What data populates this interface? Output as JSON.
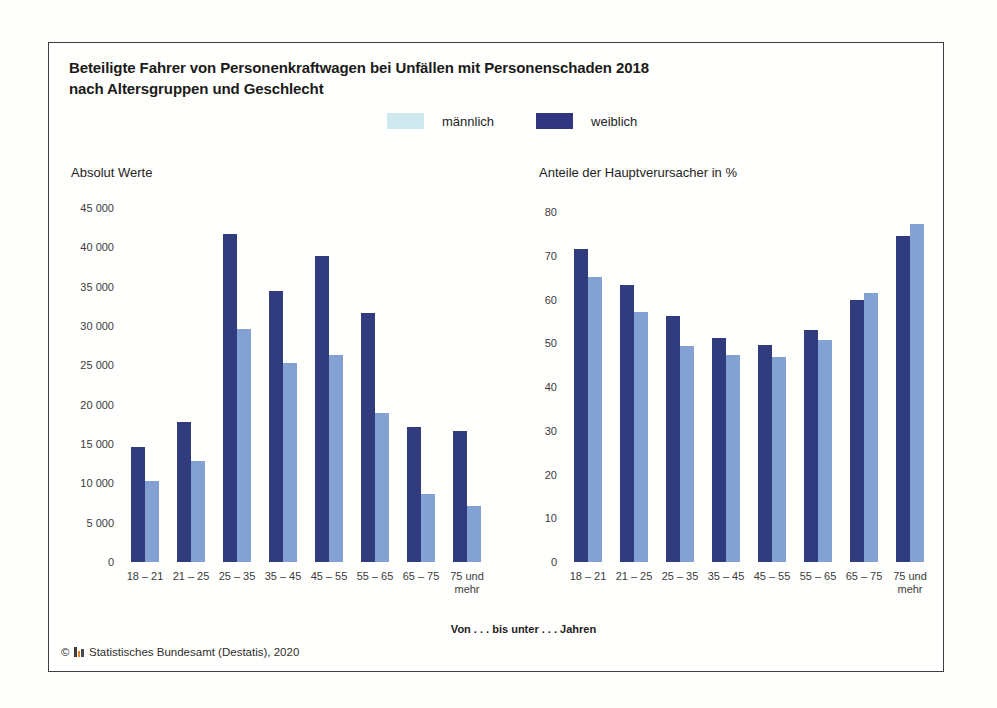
{
  "figure": {
    "title_line1": "Beteiligte Fahrer von Personenkraftwagen bei Unfällen mit Personenschaden 2018",
    "title_line2": "nach Altersgruppen und Geschlecht",
    "x_axis_caption": "Von . . . bis unter . . . Jahren",
    "footer": {
      "copyright_symbol": "©",
      "source_text": "Statistisches Bundesamt (Destatis), 2020",
      "logo_icon": "destatis-logo"
    }
  },
  "legend": {
    "position": "top-center",
    "items": [
      {
        "label": "männlich",
        "color": "#cfe9ef"
      },
      {
        "label": "weiblich",
        "color": "#31357f"
      }
    ]
  },
  "colors": {
    "bar_dark_navy": "#303c7e",
    "bar_light_blue": "#84a1d3",
    "box_border": "#3e3e3e",
    "axis_text": "#3b3b3b"
  },
  "chart_data": [
    {
      "type": "bar",
      "title": "Absolut Werte",
      "xlabel": "Von . . . bis unter . . . Jahren",
      "grid": false,
      "categories": [
        "18 – 21",
        "21 – 25",
        "25 – 35",
        "35 – 45",
        "45 – 55",
        "55 – 65",
        "65 – 75",
        "75 und mehr"
      ],
      "ylim": [
        0,
        45000
      ],
      "yticks": [
        {
          "value": 45000,
          "label": "45 000"
        },
        {
          "value": 40000,
          "label": "40 000"
        },
        {
          "value": 35000,
          "label": "35 000"
        },
        {
          "value": 30000,
          "label": "30 000"
        },
        {
          "value": 25000,
          "label": "25 000"
        },
        {
          "value": 20000,
          "label": "20 000"
        },
        {
          "value": 15000,
          "label": "15 000"
        },
        {
          "value": 10000,
          "label": "10 000"
        },
        {
          "value": 5000,
          "label": "5 000"
        },
        {
          "value": 0,
          "label": "0"
        }
      ],
      "series": [
        {
          "name": "weiblich",
          "color": "#303c7e",
          "values": [
            14600,
            17800,
            41700,
            34400,
            38900,
            31700,
            17100,
            16600
          ]
        },
        {
          "name": "männlich",
          "color": "#84a1d3",
          "values": [
            10300,
            12900,
            29600,
            25300,
            26300,
            19000,
            8700,
            7100
          ]
        }
      ]
    },
    {
      "type": "bar",
      "title": "Anteile der Hauptverursacher in %",
      "xlabel": "Von . . . bis unter . . . Jahren",
      "grid": false,
      "categories": [
        "18 – 21",
        "21 – 25",
        "25 – 35",
        "35 – 45",
        "45 – 55",
        "55 – 65",
        "65 – 75",
        "75 und mehr"
      ],
      "ylim": [
        0,
        80
      ],
      "yticks": [
        {
          "value": 80,
          "label": "80"
        },
        {
          "value": 70,
          "label": "70"
        },
        {
          "value": 60,
          "label": "60"
        },
        {
          "value": 50,
          "label": "50"
        },
        {
          "value": 40,
          "label": "40"
        },
        {
          "value": 30,
          "label": "30"
        },
        {
          "value": 20,
          "label": "20"
        },
        {
          "value": 10,
          "label": "10"
        },
        {
          "value": 0,
          "label": "0"
        }
      ],
      "series": [
        {
          "name": "weiblich",
          "color": "#303c7e",
          "values": [
            71.5,
            63.2,
            56.2,
            51.3,
            49.7,
            53.0,
            59.9,
            74.4
          ]
        },
        {
          "name": "männlich",
          "color": "#84a1d3",
          "values": [
            65.2,
            57.2,
            49.4,
            47.2,
            46.8,
            50.8,
            61.4,
            77.2
          ]
        }
      ]
    }
  ]
}
